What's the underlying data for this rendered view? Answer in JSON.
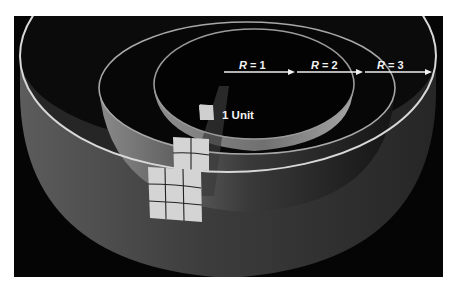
{
  "figure": {
    "radius_labels": [
      {
        "var": "R",
        "eq": " = ",
        "value": "1"
      },
      {
        "var": "R",
        "eq": " = ",
        "value": "2"
      },
      {
        "var": "R",
        "eq": " = ",
        "value": "3"
      }
    ],
    "unit_label": "1 Unit",
    "grids": [
      {
        "radius": 1,
        "rows": 1,
        "cols": 1,
        "cells": 1
      },
      {
        "radius": 2,
        "rows": 2,
        "cols": 2,
        "cells": 4
      },
      {
        "radius": 3,
        "rows": 3,
        "cols": 3,
        "cells": 9
      }
    ],
    "colors": {
      "background": "#050505",
      "rim": "#d8d8d8",
      "tile": "#d4d4d4",
      "text": "#f2f2f2"
    }
  }
}
